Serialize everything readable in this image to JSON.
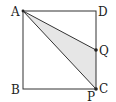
{
  "diagram": {
    "type": "geometry",
    "shape": "square ABCD with shaded triangle AQC",
    "colors": {
      "line": "#333333",
      "shade": "#e6e6e6",
      "background": "#ffffff"
    },
    "points": {
      "A": {
        "label": "A",
        "x": 23,
        "y": 11
      },
      "B": {
        "label": "B",
        "x": 23,
        "y": 89
      },
      "C": {
        "label": "C",
        "x": 96,
        "y": 89
      },
      "D": {
        "label": "D",
        "x": 96,
        "y": 11
      },
      "Q": {
        "label": "Q",
        "x": 96,
        "y": 50
      },
      "P": {
        "label": "P",
        "x": 96,
        "y": 89
      }
    },
    "labels": {
      "A": "A",
      "B": "B",
      "C": "C",
      "D": "D",
      "Q": "Q",
      "P": "P"
    },
    "segments": [
      "AB",
      "BC",
      "CD",
      "DA",
      "AQ",
      "AC"
    ],
    "shaded_region": [
      "A",
      "Q",
      "C"
    ]
  }
}
